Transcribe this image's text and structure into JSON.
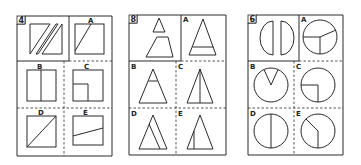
{
  "puzzles": [
    {
      "number": "4",
      "question": "square split by two parallel diagonal cuts",
      "options": [
        {
          "label": "A",
          "shape": "square with diagonal line from top to bottom-left"
        },
        {
          "label": "B",
          "shape": "square with vertical center line"
        },
        {
          "label": "C",
          "shape": "square with inner small square in lower-left"
        },
        {
          "label": "D",
          "shape": "square with full diagonal"
        },
        {
          "label": "E",
          "shape": "square with slanted line across lower half"
        }
      ]
    },
    {
      "number": "8",
      "question": "small triangle and trapezoid pieces",
      "options": [
        {
          "label": "A",
          "shape": "triangle with horizontal line low"
        },
        {
          "label": "B",
          "shape": "triangle with horizontal line high"
        },
        {
          "label": "C",
          "shape": "triangle with vertical center line"
        },
        {
          "label": "D",
          "shape": "triangle with inner slanted line"
        },
        {
          "label": "E",
          "shape": "triangle with short vertical line on left"
        }
      ]
    },
    {
      "number": "6",
      "question": "two half-circle pieces",
      "options": [
        {
          "label": "A",
          "shape": "circle divided into three sectors"
        },
        {
          "label": "B",
          "shape": "circle with V wedge at top"
        },
        {
          "label": "C",
          "shape": "circle with quarter corner lines"
        },
        {
          "label": "D",
          "shape": "circle with vertical diameter"
        },
        {
          "label": "E",
          "shape": "circle with bent line"
        }
      ]
    }
  ],
  "colors": {
    "line": "#2a2a2a",
    "background": "#ffffff"
  }
}
